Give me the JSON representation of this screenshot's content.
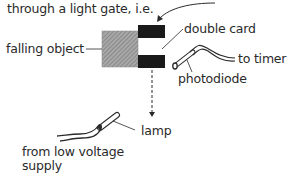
{
  "header": {
    "line_cut_off": "... cut off line above ...",
    "line2": "through a light gate, i.e."
  },
  "labels": {
    "falling_object": "falling object",
    "double_card": "double card",
    "to_timer": "to timer",
    "photodiode": "photodiode",
    "lamp": "lamp",
    "supply_line1": "from low voltage",
    "supply_line2": "supply"
  },
  "colors": {
    "ink": "#2a2a2a",
    "card_black": "#1a1a1a",
    "object_grey": "#9a9a9a"
  }
}
